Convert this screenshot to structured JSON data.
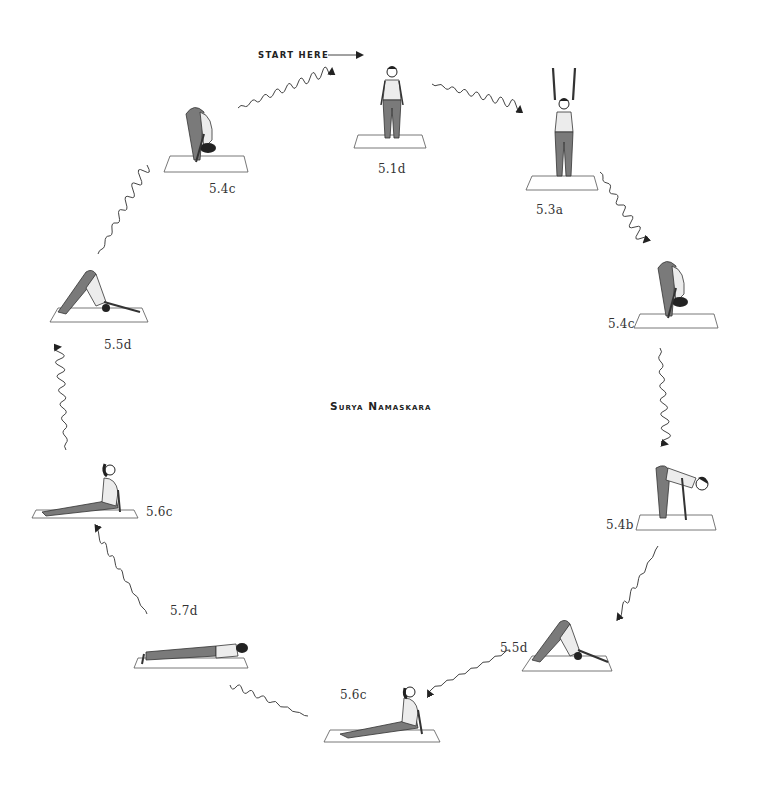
{
  "diagram": {
    "title": "Surya Namaskara",
    "start_label": "START HERE",
    "flow_direction": "clockwise",
    "poses": [
      {
        "id": "5.1d",
        "label": "5.1d",
        "name": "standing-mountain",
        "position": "top-center"
      },
      {
        "id": "5.3a",
        "label": "5.3a",
        "name": "standing-arms-raised",
        "position": "top-right"
      },
      {
        "id": "5.4c",
        "label": "5.4c",
        "name": "standing-forward-fold",
        "position": "right-upper"
      },
      {
        "id": "5.4b",
        "label": "5.4b",
        "name": "half-forward-fold",
        "position": "right-lower"
      },
      {
        "id": "5.5d",
        "label": "5.5d",
        "name": "downward-dog",
        "position": "bottom-right"
      },
      {
        "id": "5.6c",
        "label": "5.6c",
        "name": "upward-dog",
        "position": "bottom-center"
      },
      {
        "id": "5.7d",
        "label": "5.7d",
        "name": "low-plank",
        "position": "bottom-left"
      },
      {
        "id": "5.6c-b",
        "label": "5.6c",
        "name": "upward-dog",
        "position": "left-lower"
      },
      {
        "id": "5.5d-b",
        "label": "5.5d",
        "name": "downward-dog",
        "position": "left-upper"
      },
      {
        "id": "5.4c-b",
        "label": "5.4c",
        "name": "standing-forward-fold",
        "position": "top-left"
      }
    ]
  },
  "colors": {
    "ink": "#222222",
    "leggings": "#7a7a7a",
    "top": "#ececec",
    "mat": "#ffffff"
  }
}
